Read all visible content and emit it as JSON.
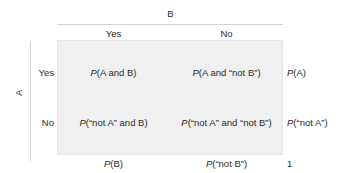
{
  "axes": {
    "column_variable_label": "B",
    "row_variable_label": "A",
    "column_headers": [
      "Yes",
      "No"
    ],
    "row_headers": [
      "Yes",
      "No"
    ]
  },
  "cells": {
    "r0c0": {
      "prefix": "P",
      "body": "(A and B)"
    },
    "r0c1": {
      "prefix": "P",
      "body": "(A and “not B”)"
    },
    "r1c0": {
      "prefix": "P",
      "body": "(“not A” and B)"
    },
    "r1c1": {
      "prefix": "P",
      "body": "(“not A” and “not B”)"
    }
  },
  "margins": {
    "right": [
      {
        "prefix": "P",
        "body": "(A)"
      },
      {
        "prefix": "P",
        "body": "(“not A”)"
      }
    ],
    "bottom": [
      {
        "prefix": "P",
        "body": "(B)"
      },
      {
        "prefix": "P",
        "body": "(“not B”)"
      }
    ],
    "grand_total": "1"
  },
  "colors": {
    "matrix_fill": "#f0f0f0",
    "matrix_border": "#e4e4e4",
    "rule": "#d2d2d2",
    "text": "#2b2b2b",
    "background": "#ffffff"
  }
}
